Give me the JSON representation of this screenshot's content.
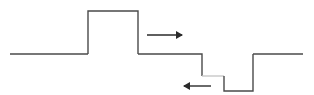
{
  "diagram": {
    "type": "potential-profile",
    "colors": {
      "line": "#4a4a4a",
      "step": "#c8c8c8",
      "arrow": "#2a2a2a",
      "background": "#ffffff"
    },
    "profile_points": [
      [
        10,
        54
      ],
      [
        88,
        54
      ],
      [
        88,
        11
      ],
      [
        138,
        11
      ],
      [
        138,
        54
      ],
      [
        202,
        54
      ],
      [
        202,
        76
      ],
      [
        224,
        76
      ],
      [
        224,
        91
      ],
      [
        253,
        91
      ],
      [
        253,
        54
      ],
      [
        303,
        54
      ]
    ],
    "arrows": [
      {
        "direction": "right",
        "x1": 147,
        "x2": 182,
        "y": 35
      },
      {
        "direction": "left",
        "x1": 211,
        "x2": 184,
        "y": 86
      }
    ]
  }
}
